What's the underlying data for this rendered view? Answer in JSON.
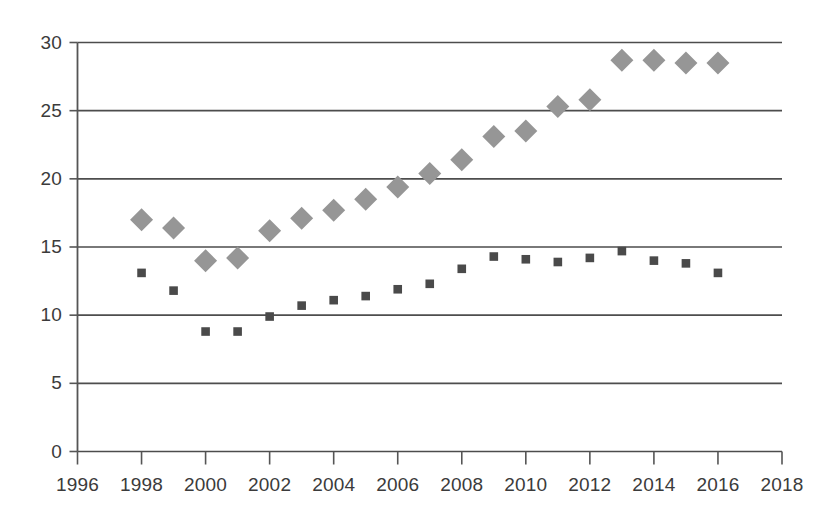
{
  "chart_data": {
    "type": "scatter",
    "title": "",
    "subtitle": "",
    "xlabel": "",
    "ylabel": "",
    "xlim": [
      1996,
      2018
    ],
    "ylim": [
      0,
      30
    ],
    "grid": true,
    "legend": "none",
    "xticks": [
      1996,
      1998,
      2000,
      2002,
      2004,
      2006,
      2008,
      2010,
      2012,
      2014,
      2016,
      2018
    ],
    "yticks": [
      0,
      5,
      10,
      15,
      20,
      25,
      30
    ],
    "xtick_labels": [
      "1996",
      "1998",
      "2000",
      "2002",
      "2004",
      "2006",
      "2008",
      "2010",
      "2012",
      "2014",
      "2016",
      "2018"
    ],
    "ytick_labels": [
      "0",
      "5",
      "10",
      "15",
      "20",
      "25",
      "30"
    ],
    "x": [
      1998,
      1999,
      2000,
      2001,
      2002,
      2003,
      2004,
      2005,
      2006,
      2007,
      2008,
      2009,
      2010,
      2011,
      2012,
      2013,
      2014,
      2015,
      2016
    ],
    "series": [
      {
        "name": "series-diamond",
        "marker": "diamond",
        "color": "#969696",
        "values": [
          17.0,
          16.4,
          14.0,
          14.2,
          16.2,
          17.1,
          17.7,
          18.5,
          19.4,
          20.4,
          21.4,
          23.1,
          23.5,
          25.3,
          25.8,
          28.7,
          28.7,
          28.5,
          28.5
        ]
      },
      {
        "name": "series-square",
        "marker": "square",
        "color": "#4a4a4a",
        "values": [
          13.1,
          11.8,
          8.8,
          8.8,
          9.9,
          10.7,
          11.1,
          11.4,
          11.9,
          12.3,
          13.4,
          14.3,
          14.1,
          13.9,
          14.2,
          14.7,
          14.0,
          13.8,
          13.1
        ]
      }
    ]
  },
  "axes": {
    "axis_color": "#555555",
    "grid_color": "#4d4d4d",
    "tick_text_color": "#3b3b3b"
  }
}
